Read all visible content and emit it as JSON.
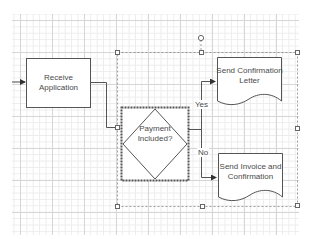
{
  "diagram": {
    "type": "flowchart",
    "nodes": [
      {
        "id": "receive",
        "shape": "process",
        "label_line1": "Receive",
        "label_line2": "Application"
      },
      {
        "id": "decision",
        "shape": "decision",
        "label_line1": "Payment",
        "label_line2": "Included?",
        "selected": true
      },
      {
        "id": "confirm",
        "shape": "document",
        "label_line1": "Send Confirmation",
        "label_line2": "Letter"
      },
      {
        "id": "invoice",
        "shape": "document",
        "label_line1": "Send Invoice and",
        "label_line2": "Confirmation"
      }
    ],
    "edges": [
      {
        "from": "start",
        "to": "receive"
      },
      {
        "from": "receive",
        "to": "decision"
      },
      {
        "from": "decision",
        "to": "confirm",
        "label": "Yes"
      },
      {
        "from": "decision",
        "to": "invoice",
        "label": "No"
      }
    ],
    "colors": {
      "stroke": "#555555",
      "text": "#4a4a4a",
      "grid_major": "#d6d6d6",
      "grid_minor": "#ececec",
      "selection": "#777777"
    }
  }
}
